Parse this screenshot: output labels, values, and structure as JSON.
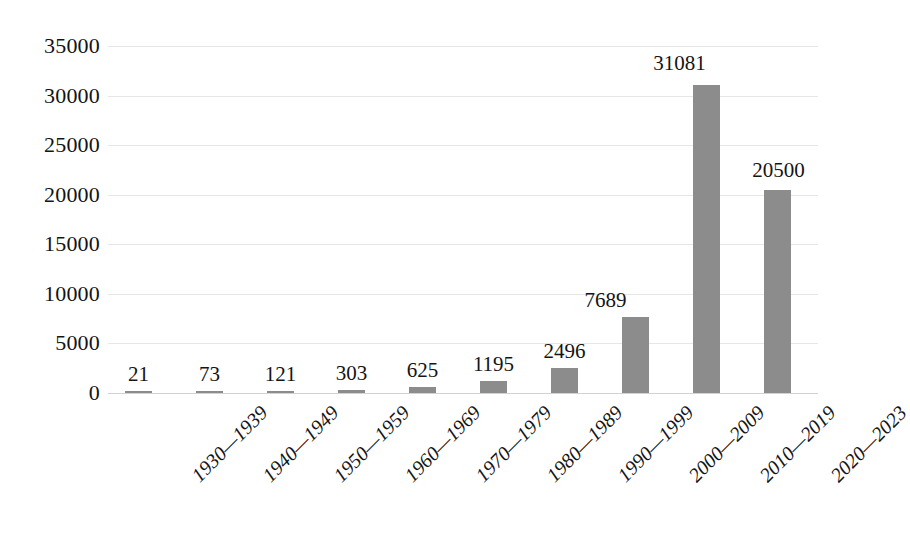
{
  "chart_data": {
    "type": "bar",
    "title": "",
    "subtitle": "",
    "xlabel": "",
    "ylabel": "",
    "categories": [
      "1930—1939",
      "1940—1949",
      "1950—1959",
      "1960—1969",
      "1970—1979",
      "1980—1989",
      "1990—1999",
      "2000—2009",
      "2010—2019",
      "2020—2023"
    ],
    "values": [
      21,
      73,
      121,
      303,
      625,
      1195,
      2496,
      7689,
      31081,
      20500
    ],
    "data_labels": [
      "21",
      "73",
      "121",
      "303",
      "625",
      "1195",
      "2496",
      "7689",
      "31081",
      "20500"
    ],
    "ylim": [
      0,
      35000
    ],
    "ytick_values": [
      0,
      5000,
      10000,
      15000,
      20000,
      25000,
      30000,
      35000
    ],
    "ytick_labels": [
      "0",
      "5000",
      "10000",
      "15000",
      "20000",
      "25000",
      "30000",
      "35000"
    ],
    "grid": true,
    "legend": false,
    "legend_position": "none",
    "bar_color": "#8c8c8c",
    "gridline_color": "#e6e6e6",
    "background_color": "#ffffff",
    "text_color": "#141414"
  }
}
